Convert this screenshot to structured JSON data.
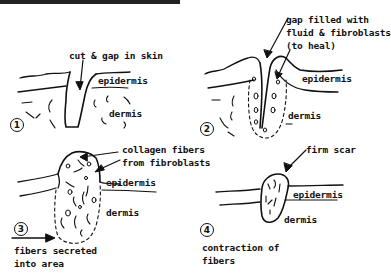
{
  "diagram": {
    "type": "hand-drawn stages of skin wound healing",
    "panels": [
      {
        "step": "1",
        "labels": {
          "annotation": "cut & gap in skin",
          "epidermis": "epidermis",
          "dermis": "dermis"
        }
      },
      {
        "step": "2",
        "labels": {
          "annotation_line1": "gap filled with",
          "annotation_line2": "fluid & fibroblasts",
          "annotation_line3": "(to heal)",
          "epidermis": "epidermis",
          "dermis": "dermis"
        }
      },
      {
        "step": "3",
        "labels": {
          "annotation_line1": "collagen fibers",
          "annotation_line2": "from fibroblasts",
          "epidermis": "epidermis",
          "dermis": "dermis",
          "caption_line1": "fibers secreted",
          "caption_line2": "into area"
        }
      },
      {
        "step": "4",
        "labels": {
          "annotation": "firm scar",
          "epidermis": "epidermis",
          "dermis": "dermis",
          "caption_line1": "contraction of",
          "caption_line2": "fibers"
        }
      }
    ],
    "colors": {
      "ink": "#111111",
      "background": "#ffffff"
    }
  }
}
